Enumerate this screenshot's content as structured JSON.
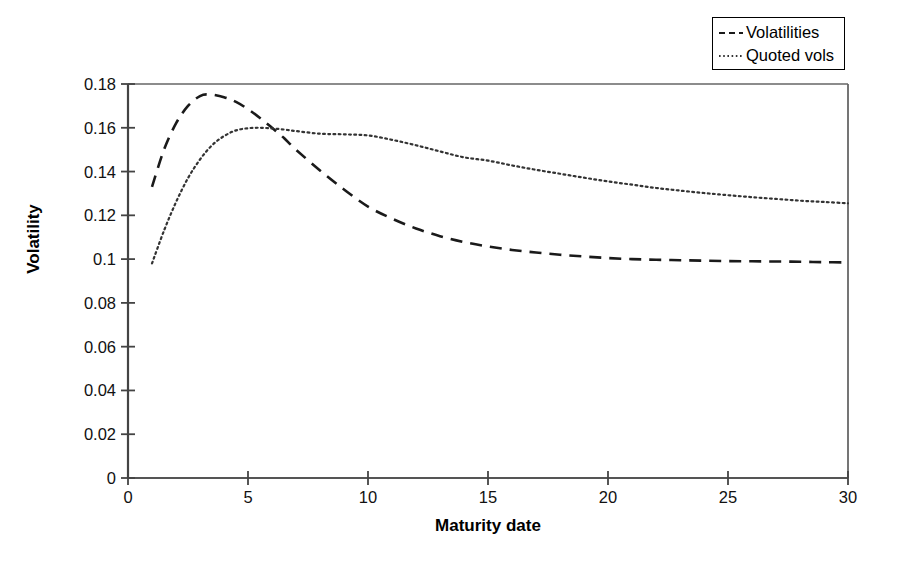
{
  "chart_data": {
    "type": "line",
    "title": "",
    "xlabel": "Maturity date",
    "ylabel": "Volatility",
    "xlim": [
      0,
      30
    ],
    "ylim": [
      0,
      0.18
    ],
    "xticks": [
      "0",
      "5",
      "10",
      "15",
      "20",
      "25",
      "30"
    ],
    "xtick_values": [
      0,
      5,
      10,
      15,
      20,
      25,
      30
    ],
    "yticks": [
      "0",
      "0.02",
      "0.04",
      "0.06",
      "0.08",
      "0.1",
      "0.12",
      "0.14",
      "0.16",
      "0.18"
    ],
    "ytick_values": [
      0,
      0.02,
      0.04,
      0.06,
      0.08,
      0.1,
      0.12,
      0.14,
      0.16,
      0.18
    ],
    "grid": false,
    "legend_position": "top-right",
    "series": [
      {
        "name": "Volatilities",
        "style": "dashed",
        "color": "#1a1a1a",
        "x": [
          1,
          1.5,
          2,
          2.5,
          3,
          3.4,
          4,
          4.5,
          5,
          5.5,
          6,
          6.5,
          7,
          8,
          9,
          10,
          11,
          12,
          13,
          14,
          15,
          16,
          17,
          18,
          19,
          20,
          21,
          22,
          23,
          24,
          25,
          26,
          27,
          28,
          29,
          30
        ],
        "y": [
          0.133,
          0.15,
          0.162,
          0.17,
          0.1745,
          0.1752,
          0.174,
          0.1718,
          0.1685,
          0.1645,
          0.16,
          0.1553,
          0.15,
          0.1405,
          0.1318,
          0.124,
          0.1185,
          0.114,
          0.1105,
          0.1078,
          0.1058,
          0.1042,
          0.103,
          0.102,
          0.1012,
          0.1005,
          0.1,
          0.0997,
          0.0995,
          0.0993,
          0.0991,
          0.099,
          0.0989,
          0.0988,
          0.0986,
          0.0985
        ]
      },
      {
        "name": "Quoted vols",
        "style": "dotted",
        "color": "#333333",
        "x": [
          1,
          1.5,
          2,
          2.5,
          3,
          3.5,
          4,
          4.5,
          5,
          5.5,
          6,
          6.5,
          7,
          8,
          9,
          10,
          11,
          12,
          13,
          14,
          15,
          16,
          17,
          18,
          19,
          20,
          21,
          22,
          23,
          24,
          25,
          26,
          27,
          28,
          29,
          30
        ],
        "y": [
          0.098,
          0.113,
          0.126,
          0.137,
          0.1455,
          0.152,
          0.1562,
          0.1588,
          0.1598,
          0.16,
          0.1597,
          0.1592,
          0.1585,
          0.1573,
          0.157,
          0.1565,
          0.1545,
          0.152,
          0.1492,
          0.1465,
          0.145,
          0.1428,
          0.1408,
          0.139,
          0.1372,
          0.1355,
          0.134,
          0.1325,
          0.1313,
          0.1302,
          0.1292,
          0.1283,
          0.1275,
          0.1267,
          0.1261,
          0.1255
        ]
      }
    ]
  },
  "legend": {
    "items": [
      {
        "label": "Volatilities",
        "style": "dashed"
      },
      {
        "label": "Quoted vols",
        "style": "dotted"
      }
    ]
  },
  "axes": {
    "x_title": "Maturity date",
    "y_title": "Volatility"
  }
}
